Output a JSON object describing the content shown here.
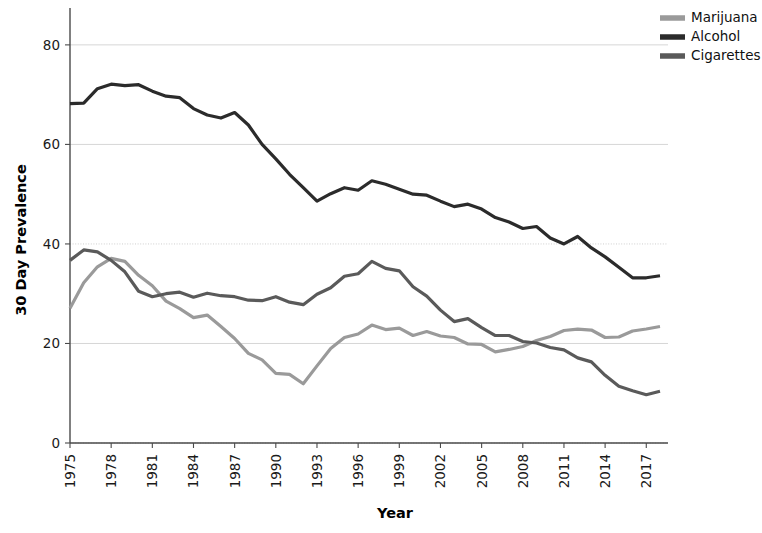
{
  "chart_data": {
    "type": "line",
    "title": "",
    "xlabel": "Year",
    "ylabel": "30 Day Prevalence",
    "xlim": [
      1975,
      2018
    ],
    "ylim": [
      0,
      85
    ],
    "yticks": [
      0,
      20,
      40,
      60,
      80
    ],
    "ytick_labels": [
      "0",
      "20",
      "40",
      "60",
      "80"
    ],
    "xticks": [
      1975,
      1978,
      1981,
      1984,
      1987,
      1990,
      1993,
      1996,
      1999,
      2002,
      2005,
      2008,
      2011,
      2014,
      2017
    ],
    "xtick_labels": [
      "1975",
      "1978",
      "1981",
      "1984",
      "1987",
      "1990",
      "1993",
      "1996",
      "1999",
      "2002",
      "2005",
      "2008",
      "2011",
      "2014",
      "2017"
    ],
    "xtick_rotation": 90,
    "grid": true,
    "legend_position": "top-right",
    "x": [
      1975,
      1976,
      1977,
      1978,
      1979,
      1980,
      1981,
      1982,
      1983,
      1984,
      1985,
      1986,
      1987,
      1988,
      1989,
      1990,
      1991,
      1992,
      1993,
      1994,
      1995,
      1996,
      1997,
      1998,
      1999,
      2000,
      2001,
      2002,
      2003,
      2004,
      2005,
      2006,
      2007,
      2008,
      2009,
      2010,
      2011,
      2012,
      2013,
      2014,
      2015,
      2016,
      2017,
      2018
    ],
    "series": [
      {
        "name": "Marijuana",
        "color": "#9a9a9a",
        "values": [
          27.1,
          32.2,
          35.4,
          37.1,
          36.5,
          33.7,
          31.6,
          28.5,
          27.0,
          25.2,
          25.7,
          23.4,
          21.0,
          18.0,
          16.7,
          14.0,
          13.8,
          11.9,
          15.5,
          19.0,
          21.2,
          21.9,
          23.7,
          22.8,
          23.1,
          21.6,
          22.4,
          21.5,
          21.2,
          19.9,
          19.8,
          18.3,
          18.8,
          19.4,
          20.6,
          21.4,
          22.6,
          22.9,
          22.7,
          21.2,
          21.3,
          22.5,
          22.9,
          23.4
        ]
      },
      {
        "name": "Alcohol",
        "color": "#2b2b2b",
        "values": [
          68.2,
          68.3,
          71.2,
          72.1,
          71.8,
          72.0,
          70.7,
          69.7,
          69.4,
          67.2,
          65.9,
          65.3,
          66.4,
          63.9,
          60.0,
          57.1,
          54.0,
          51.3,
          48.6,
          50.1,
          51.3,
          50.8,
          52.7,
          52.0,
          51.0,
          50.0,
          49.8,
          48.6,
          47.5,
          48.0,
          47.0,
          45.3,
          44.4,
          43.1,
          43.5,
          41.2,
          40.0,
          41.5,
          39.2,
          37.4,
          35.3,
          33.2,
          33.2,
          33.6
        ]
      },
      {
        "name": "Cigarettes",
        "color": "#5a5a5a",
        "values": [
          36.7,
          38.8,
          38.4,
          36.7,
          34.4,
          30.5,
          29.4,
          30.0,
          30.3,
          29.3,
          30.1,
          29.6,
          29.4,
          28.7,
          28.6,
          29.4,
          28.3,
          27.8,
          29.9,
          31.2,
          33.5,
          34.0,
          36.5,
          35.1,
          34.6,
          31.4,
          29.5,
          26.7,
          24.4,
          25.0,
          23.2,
          21.6,
          21.6,
          20.4,
          20.1,
          19.2,
          18.7,
          17.1,
          16.3,
          13.6,
          11.4,
          10.5,
          9.7,
          10.4
        ]
      }
    ],
    "annotations": []
  },
  "legend": {
    "items": [
      {
        "label": "Marijuana"
      },
      {
        "label": "Alcohol"
      },
      {
        "label": "Cigarettes"
      }
    ]
  },
  "axes": {
    "x_title": "Year",
    "y_title": "30 Day Prevalence"
  }
}
